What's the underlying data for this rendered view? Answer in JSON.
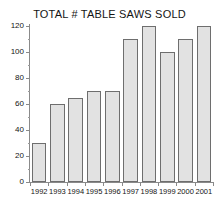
{
  "chart_data": {
    "type": "bar",
    "title": "TOTAL # TABLE SAWS SOLD",
    "xlabel": "",
    "ylabel": "",
    "categories": [
      "1992",
      "1993",
      "1994",
      "1995",
      "1996",
      "1997",
      "1998",
      "1999",
      "2000",
      "2001"
    ],
    "values": [
      30,
      60,
      65,
      70,
      70,
      110,
      120,
      100,
      110,
      120
    ],
    "ylim": [
      0,
      120
    ],
    "ytick_labels": [
      "0",
      "20",
      "40",
      "60",
      "80",
      "100",
      "120"
    ],
    "ytick_values": [
      0,
      20,
      40,
      60,
      80,
      100,
      120
    ],
    "yminor_values": [
      10,
      30,
      50,
      70,
      90,
      110
    ],
    "grid": false,
    "legend": false,
    "legend_position": "none",
    "colors": {
      "bar_fill": "#e2e2e2",
      "bar_border": "#6e6e6e",
      "axis": "#8a8a8a",
      "text": "#141414",
      "background": "#ffffff"
    }
  }
}
